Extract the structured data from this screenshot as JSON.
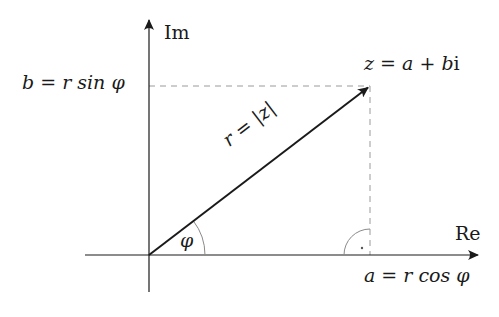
{
  "diagram": {
    "axes": {
      "imaginary_label": "Im",
      "real_label": "Re"
    },
    "labels": {
      "point": "z = a + b i",
      "point_parts": [
        "z",
        "=",
        "a",
        "+",
        "b",
        "i"
      ],
      "modulus": "r = |z|",
      "angle": "φ",
      "imag_projection": "b = r sin φ",
      "real_projection": "a = r cos φ"
    },
    "colors": {
      "axis": "#1a1a1a",
      "vector": "#1a1a1a",
      "dashed": "#9a9a9a",
      "arc": "#8a8a8a",
      "background": "#ffffff"
    },
    "geometry": {
      "origin": [
        149,
        255
      ],
      "tip": [
        370,
        86
      ],
      "angle_arc_radius": 56,
      "right_angle_radius": 26
    }
  }
}
